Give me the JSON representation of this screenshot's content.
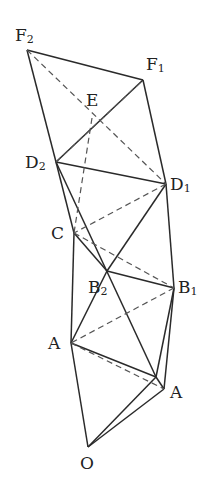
{
  "diagram": {
    "type": "geometric-construction",
    "points": {
      "O": {
        "label": "O",
        "sub": "",
        "x": 88,
        "y": 447,
        "lx": 80,
        "ly": 455
      },
      "A1": {
        "label": "A",
        "sub": "",
        "x": 164,
        "y": 389,
        "lx": 170,
        "ly": 384
      },
      "A2": {
        "label": "A",
        "sub": "",
        "x": 71,
        "y": 343,
        "lx": 48,
        "ly": 335
      },
      "P": {
        "label": "",
        "sub": "",
        "x": 156,
        "y": 377
      },
      "B1": {
        "label": "B",
        "sub": "1",
        "x": 174,
        "y": 288,
        "lx": 178,
        "ly": 279
      },
      "B2": {
        "label": "B",
        "sub": "2",
        "x": 107,
        "y": 271,
        "lx": 88,
        "ly": 279
      },
      "C": {
        "label": "C",
        "sub": "",
        "x": 74,
        "y": 233,
        "lx": 51,
        "ly": 225
      },
      "D1": {
        "label": "D",
        "sub": "1",
        "x": 166,
        "y": 184,
        "lx": 170,
        "ly": 176
      },
      "D2": {
        "label": "D",
        "sub": "2",
        "x": 56,
        "y": 162,
        "lx": 25,
        "ly": 154
      },
      "E": {
        "label": "E",
        "sub": "",
        "x": 92,
        "y": 118,
        "lx": 86,
        "ly": 92
      },
      "F1": {
        "label": "F",
        "sub": "1",
        "x": 143,
        "y": 80,
        "lx": 146,
        "ly": 56
      },
      "F2": {
        "label": "F",
        "sub": "2",
        "x": 27,
        "y": 50,
        "lx": 15,
        "ly": 27
      }
    },
    "solid_edges": [
      [
        "F2",
        "F1"
      ],
      [
        "F1",
        "D1"
      ],
      [
        "F2",
        "D2"
      ],
      [
        "D2",
        "F1"
      ],
      [
        "D2",
        "D1"
      ],
      [
        "D2",
        "C"
      ],
      [
        "D2",
        "P"
      ],
      [
        "D1",
        "B1"
      ],
      [
        "D1",
        "B2"
      ],
      [
        "C",
        "B2"
      ],
      [
        "C",
        "A2"
      ],
      [
        "B2",
        "B1"
      ],
      [
        "B2",
        "A2"
      ],
      [
        "B1",
        "P"
      ],
      [
        "B1",
        "A1"
      ],
      [
        "A2",
        "P"
      ],
      [
        "A2",
        "O"
      ],
      [
        "O",
        "A1"
      ],
      [
        "O",
        "P"
      ],
      [
        "P",
        "A1"
      ]
    ],
    "dashed_edges": [
      [
        "F2",
        "D1"
      ],
      [
        "D2",
        "F1"
      ],
      [
        "E",
        "C"
      ],
      [
        "D1",
        "C"
      ],
      [
        "C",
        "B1"
      ],
      [
        "B1",
        "A2"
      ],
      [
        "A2",
        "A1"
      ]
    ],
    "labels": [
      "F2",
      "F1",
      "E",
      "D2",
      "D1",
      "C",
      "B2",
      "B1",
      "A",
      "A",
      "O"
    ]
  }
}
